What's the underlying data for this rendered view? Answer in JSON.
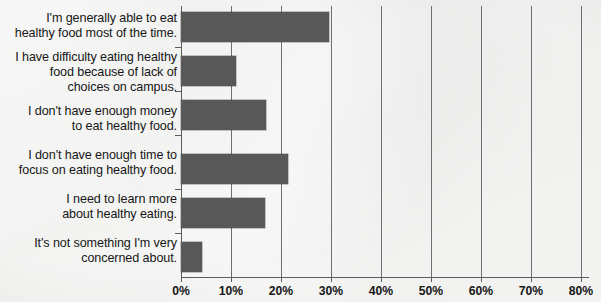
{
  "chart_data": {
    "type": "bar",
    "orientation": "horizontal",
    "title": "",
    "subtitle": "",
    "xlabel": "",
    "ylabel": "",
    "xlim": [
      0,
      80
    ],
    "grid": true,
    "legend": null,
    "categories": [
      "I'm generally able to eat healthy food most of the time.",
      "I have difficulty eating healthy food because of lack of choices on campus.",
      "I don't have enough money to eat healthy food.",
      "I don't have enough time to focus on eating healthy food.",
      "I need to learn more about healthy eating.",
      "It's not something I'm very concerned about."
    ],
    "values": [
      29.5,
      11.0,
      17.0,
      21.4,
      16.8,
      4.2
    ],
    "value_unit": "%",
    "xticks": [
      0,
      10,
      20,
      30,
      40,
      50,
      60,
      70,
      80
    ],
    "xtick_labels": [
      "0%",
      "10%",
      "20%",
      "30%",
      "40%",
      "50%",
      "60%",
      "70%",
      "80%"
    ],
    "bar_color": "#585858",
    "background_color": "#e8e8e6",
    "axis_color": "#5c5c5c"
  },
  "category_label_lines": [
    [
      "I'm generally able to eat",
      "healthy food most of the time."
    ],
    [
      "I have difficulty eating healthy",
      "food because of lack of",
      "choices on campus."
    ],
    [
      "I don't have enough money",
      "to eat healthy food."
    ],
    [
      "I don't have enough time to",
      "focus on eating healthy food."
    ],
    [
      "I need to learn more",
      "about healthy eating."
    ],
    [
      "It's not something I'm very",
      "concerned about."
    ]
  ]
}
